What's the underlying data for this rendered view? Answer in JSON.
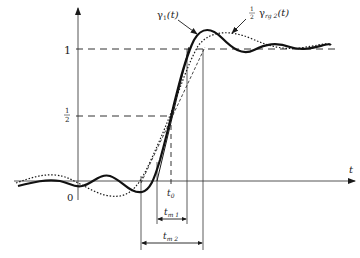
{
  "figure": {
    "type": "step-response-diagram",
    "axes": {
      "x_label": "t",
      "origin_label": "0",
      "y_ticks": [
        {
          "label": "1",
          "value": 1
        },
        {
          "label_num": "1",
          "label_den": "2",
          "value": 0.5
        }
      ]
    },
    "curves": [
      {
        "name": "gamma1",
        "label_main": "γ",
        "label_sub": "1",
        "label_arg": "(t)",
        "style": "solid-thick"
      },
      {
        "name": "half-gamma-rg2",
        "label_frac_num": "1",
        "label_frac_den": "2",
        "label_main": "γ",
        "label_sub": "rg 2",
        "label_arg": "(t)",
        "style": "dotted"
      }
    ],
    "markers": {
      "t0": {
        "main": "t",
        "sub": "0"
      },
      "tm1": {
        "main": "t",
        "sub": "m 1"
      },
      "tm2": {
        "main": "t",
        "sub": "m 2"
      }
    },
    "colors": {
      "ink": "#1a1a1a",
      "background": "#ffffff",
      "grey": "#555555"
    }
  }
}
